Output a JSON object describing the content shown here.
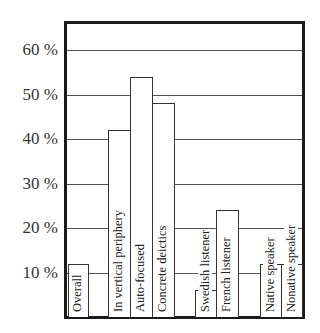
{
  "chart_data": {
    "type": "bar",
    "title": "",
    "xlabel": "",
    "ylabel": "",
    "ylim": [
      0,
      60
    ],
    "y_ticks": [
      "10 %",
      "20 %",
      "30 %",
      "40 %",
      "50 %",
      "60 %"
    ],
    "y_tick_values": [
      10,
      20,
      30,
      40,
      50,
      60
    ],
    "grid": true,
    "legend": "none",
    "categories": [
      "Overall",
      "In vertical periphery",
      "Auto-focused",
      "Concrete deictics",
      "Swedish listener",
      "French listener",
      "Native speaker",
      "Nonative speaker"
    ],
    "values": [
      12,
      42,
      54,
      48,
      6,
      24,
      12,
      12
    ],
    "groups": [
      {
        "name": "overall",
        "members": [
          "Overall"
        ]
      },
      {
        "name": "gaze",
        "members": [
          "In vertical periphery",
          "Auto-focused",
          "Concrete deictics"
        ]
      },
      {
        "name": "listener",
        "members": [
          "Swedish listener",
          "French listener"
        ]
      },
      {
        "name": "speaker",
        "members": [
          "Native speaker",
          "Nonative speaker"
        ]
      }
    ],
    "bar_fill": "#ffffff",
    "bar_edge": "#333333",
    "frame_color": "#1a1a1a"
  }
}
